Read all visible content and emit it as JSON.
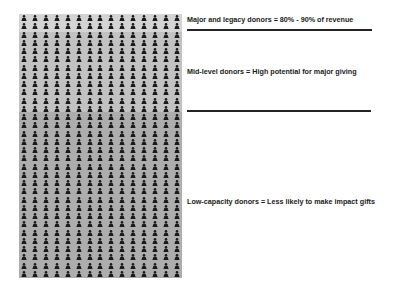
{
  "diagram": {
    "grid": {
      "columns": 15,
      "rows": 32,
      "icon": "person-icon",
      "bands": [
        {
          "name": "major-legacy",
          "rows": 2,
          "color": "#d4d4d4"
        },
        {
          "name": "mid-level",
          "rows": 10,
          "color": "#c2c2c2"
        },
        {
          "name": "low-capacity",
          "rows": 20,
          "color": "#adadad"
        }
      ],
      "icon_color": "#1a1a1a"
    },
    "labels": {
      "major": "Major and legacy donors = 80% - 90% of revenue",
      "mid": "Mid-level donors = High potential for major giving",
      "low": "Low-capacity donors = Less likely to make impact gifts"
    }
  }
}
